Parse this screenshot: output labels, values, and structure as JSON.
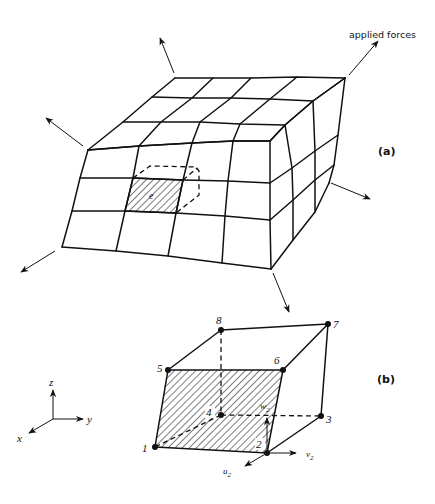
{
  "figure": {
    "annotation": "applied forces",
    "panel_a_label": "(a)",
    "panel_b_label": "(b)",
    "element_label": "e"
  },
  "axes": {
    "x": "x",
    "y": "y",
    "z": "z"
  },
  "nodes": [
    "1",
    "2",
    "3",
    "4",
    "5",
    "6",
    "7",
    "8"
  ],
  "displacements": {
    "u": "u",
    "v": "v",
    "w": "w",
    "subscript": "2"
  },
  "colors": {
    "ink": "#111111",
    "background": "#ffffff"
  }
}
